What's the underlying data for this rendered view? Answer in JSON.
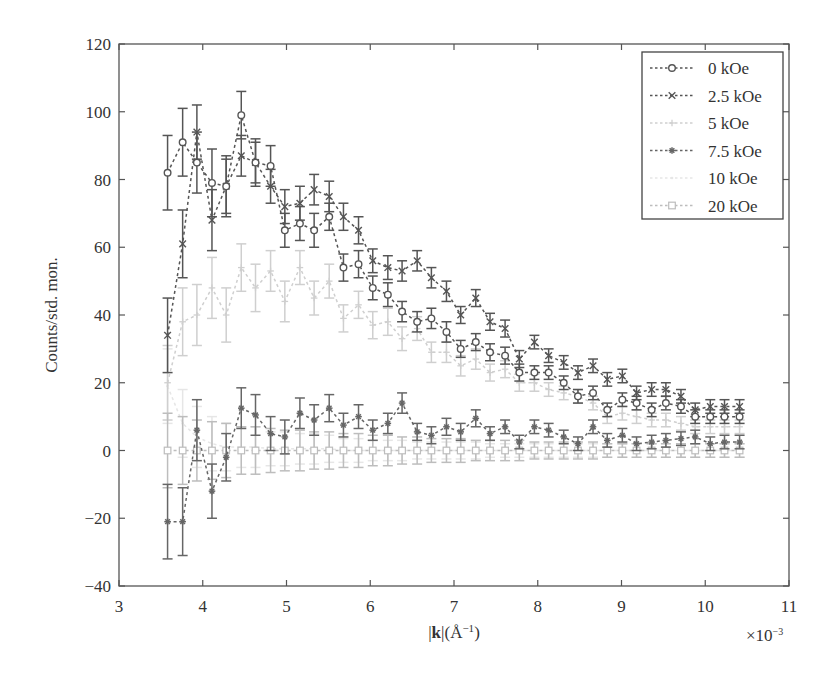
{
  "chart_data": {
    "type": "line",
    "title": "",
    "xlabel": "|k|(Å⁻¹)",
    "xlabel_bold_part": "k",
    "ylabel": "Counts/std. mon.",
    "x_multiplier_label": "×10⁻³",
    "xlim": [
      3,
      11
    ],
    "ylim": [
      -40,
      120
    ],
    "xticks": [
      3,
      4,
      5,
      6,
      7,
      8,
      9,
      10,
      11
    ],
    "yticks": [
      -40,
      -20,
      0,
      20,
      40,
      60,
      80,
      100,
      120
    ],
    "grid": false,
    "legend_position": "upper right",
    "error_bars": true,
    "x": [
      3.58,
      3.76,
      3.93,
      4.11,
      4.28,
      4.46,
      4.63,
      4.81,
      4.98,
      5.16,
      5.33,
      5.51,
      5.68,
      5.86,
      6.03,
      6.21,
      6.38,
      6.56,
      6.73,
      6.91,
      7.08,
      7.26,
      7.43,
      7.61,
      7.78,
      7.96,
      8.13,
      8.31,
      8.48,
      8.66,
      8.83,
      9.01,
      9.18,
      9.36,
      9.53,
      9.71,
      9.88,
      10.06,
      10.23,
      10.41
    ],
    "series": [
      {
        "name": "0 kOe",
        "marker": "circle",
        "color": "#555555",
        "values": [
          82,
          91,
          85,
          79,
          78,
          99,
          85,
          84,
          65,
          67,
          65,
          69,
          54,
          55,
          48,
          46,
          41,
          38,
          39,
          35,
          30,
          32,
          29,
          28,
          23,
          23,
          23,
          20,
          16,
          17,
          12,
          15,
          14,
          12,
          14,
          13,
          10,
          10,
          10,
          10
        ],
        "errors": [
          11,
          10,
          9,
          10,
          9,
          7,
          7,
          6,
          5,
          5,
          5,
          4,
          4,
          4,
          3.5,
          3.5,
          3,
          3,
          3,
          3,
          2.5,
          2.5,
          2.5,
          2.5,
          2.5,
          2,
          2,
          2,
          2,
          2,
          2,
          2,
          2,
          2,
          2,
          2,
          2,
          2,
          2,
          2
        ]
      },
      {
        "name": "2.5 kOe",
        "marker": "x",
        "color": "#555555",
        "values": [
          34,
          61,
          94,
          68,
          78,
          87,
          85,
          78,
          72,
          73,
          77,
          75,
          69,
          65,
          56,
          54,
          53,
          56,
          51,
          47,
          40,
          45,
          38,
          36,
          27,
          32,
          28,
          26,
          23,
          25,
          21,
          22,
          17,
          18,
          18,
          16,
          12,
          13,
          13,
          13
        ],
        "errors": [
          11,
          10,
          8,
          9,
          8,
          6,
          6,
          5,
          5,
          5,
          4.5,
          4.5,
          4,
          4,
          3.5,
          3.5,
          3,
          3,
          3,
          3,
          2.5,
          2.5,
          2.5,
          2.5,
          2.5,
          2,
          2,
          2,
          2,
          2,
          2,
          2,
          2,
          2,
          2,
          2,
          2,
          2,
          2,
          2
        ]
      },
      {
        "name": "5 kOe",
        "marker": "plus",
        "color": "#cfcfcf",
        "values": [
          20,
          38,
          40,
          48,
          40,
          54,
          48,
          53,
          44,
          54,
          45,
          50,
          39,
          43,
          37,
          38,
          33,
          36,
          29,
          29,
          25,
          27,
          23,
          24,
          20,
          20,
          18,
          17,
          16,
          14,
          10,
          11,
          10,
          9,
          9,
          8,
          7,
          7,
          7,
          7
        ],
        "errors": [
          11,
          10,
          9,
          9,
          8,
          7,
          7,
          6,
          6,
          5,
          5,
          5,
          4,
          4,
          4,
          4,
          3.5,
          3.5,
          3,
          3,
          3,
          3,
          2.5,
          2.5,
          2.5,
          2.5,
          2,
          2,
          2,
          2,
          2,
          2,
          2,
          2,
          2,
          2,
          2,
          2,
          2,
          2
        ]
      },
      {
        "name": "7.5 kOe",
        "marker": "asterisk",
        "color": "#666666",
        "values": [
          -21,
          -21,
          6,
          -12,
          -2,
          12.5,
          10.5,
          5,
          4,
          11,
          9,
          12.5,
          7.5,
          10,
          6,
          8,
          14,
          5.5,
          4.5,
          7,
          5.5,
          9.5,
          5,
          7,
          2.5,
          7,
          6,
          4,
          2,
          7,
          3,
          4.5,
          2,
          2.5,
          3,
          3.5,
          4,
          2,
          2.5,
          2.5
        ],
        "errors": [
          11,
          10,
          9,
          8,
          7,
          6,
          6,
          5,
          5,
          4.5,
          4.5,
          4,
          3.5,
          3.5,
          3,
          3,
          3,
          2.5,
          2.5,
          2.5,
          2.5,
          2.5,
          2,
          2,
          2,
          2,
          2,
          2,
          2,
          2,
          2,
          2,
          2,
          2,
          2,
          2,
          2,
          2,
          2,
          2
        ]
      },
      {
        "name": "10 kOe",
        "marker": "dot",
        "color": "#e6e6e6",
        "values": [
          19,
          8,
          4,
          2,
          1,
          1,
          1,
          0.5,
          0.5,
          0.5,
          0.5,
          0.5,
          0,
          0,
          0,
          0,
          0,
          0,
          0,
          0,
          0,
          0,
          0,
          0,
          0,
          0,
          0,
          0,
          0,
          0,
          0,
          0,
          0,
          0,
          0,
          0,
          0,
          0,
          0,
          0
        ],
        "errors": [
          11,
          10,
          9,
          8,
          7,
          6,
          6,
          5,
          5,
          4.5,
          4.5,
          4,
          3.5,
          3.5,
          3,
          3,
          3,
          2.5,
          2.5,
          2.5,
          2.5,
          2.5,
          2,
          2,
          2,
          2,
          2,
          2,
          2,
          2,
          2,
          2,
          2,
          2,
          2,
          2,
          2,
          2,
          2,
          2
        ]
      },
      {
        "name": "20 kOe",
        "marker": "square",
        "color": "#bdbdbd",
        "values": [
          0,
          0,
          0,
          0,
          0,
          0,
          0,
          0,
          0,
          0,
          0,
          0,
          0,
          0,
          0,
          0,
          0,
          0,
          0,
          0,
          0,
          0,
          0,
          0,
          0,
          0,
          0,
          0,
          0,
          0,
          0,
          0,
          0,
          0,
          0,
          0,
          0,
          0,
          0,
          0
        ],
        "errors": [
          11,
          10,
          9,
          8.5,
          8,
          7,
          7,
          6.5,
          6,
          6,
          5.5,
          5.5,
          5,
          5,
          4.5,
          4.5,
          4,
          4,
          3.5,
          3.5,
          3.5,
          3,
          3,
          3,
          3,
          2.5,
          2.5,
          2.5,
          2.5,
          2.5,
          2,
          2,
          2,
          2,
          2,
          2,
          2,
          2,
          2,
          2
        ]
      }
    ]
  }
}
